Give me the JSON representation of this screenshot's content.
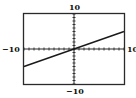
{
  "chart_data": {
    "type": "line",
    "title": "",
    "xlabel": "",
    "ylabel": "",
    "xlim": [
      -10,
      10
    ],
    "ylim": [
      -10,
      10
    ],
    "xscl": 1,
    "yscl": 1,
    "grid": false,
    "tick_labels": {
      "top": "10",
      "bottom": "−10",
      "left": "−10",
      "right": "10"
    },
    "series": [
      {
        "name": "y = 0.5x",
        "x": [
          -10,
          10
        ],
        "y": [
          -5,
          5
        ]
      }
    ]
  },
  "colors": {
    "frame": "#2a2a2a",
    "axis": "#2a2a2a",
    "line": "#1a1a1a",
    "background": "#ffffff"
  }
}
